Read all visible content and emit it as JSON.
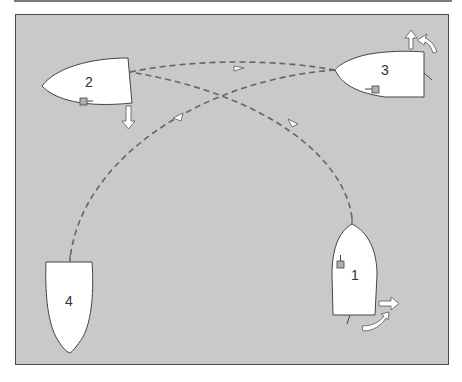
{
  "diagram": {
    "type": "boat-maneuver-sequence",
    "background_color": "#c9c9c9",
    "hull_color": "#ffffff",
    "path_color": "#666666",
    "boats": [
      {
        "id": "boat-1",
        "label": "1",
        "orientation": "bow-up"
      },
      {
        "id": "boat-2",
        "label": "2",
        "orientation": "bow-left"
      },
      {
        "id": "boat-3",
        "label": "3",
        "orientation": "bow-left"
      },
      {
        "id": "boat-4",
        "label": "4",
        "orientation": "bow-down"
      }
    ],
    "paths": [
      {
        "from": "1",
        "to": "2",
        "style": "dashed",
        "arrow": "toward-2"
      },
      {
        "from": "2",
        "to": "3",
        "style": "dashed",
        "arrow": "toward-3"
      },
      {
        "from": "3",
        "to": "4",
        "style": "dashed",
        "arrow": "toward-4"
      }
    ],
    "motion_arrows": [
      {
        "boat": "1",
        "type": "straight",
        "direction": "right"
      },
      {
        "boat": "1",
        "type": "curved",
        "direction": "clockwise"
      },
      {
        "boat": "2",
        "type": "straight",
        "direction": "down"
      },
      {
        "boat": "3",
        "type": "straight",
        "direction": "up"
      },
      {
        "boat": "3",
        "type": "curved",
        "direction": "clockwise"
      }
    ]
  }
}
